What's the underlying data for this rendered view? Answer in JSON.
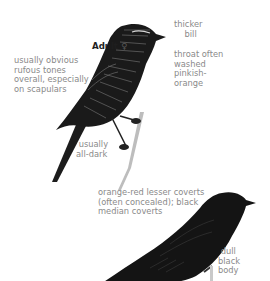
{
  "figure": {
    "top_bird": {
      "title": "Adult",
      "sex_symbol": "♀",
      "annotations": {
        "bill": "thicker\n    bill",
        "throat": "throat often\nwashed\npinkish-\norange",
        "scapulars": "usually obvious\nrufous tones\noverall, especially\non scapulars",
        "legs": " usually\nall-dark"
      }
    },
    "bottom_bird": {
      "annotations": {
        "coverts": "orange-red lesser coverts\n(often concealed); black\nmedian coverts",
        "body": " dull\nblack\nbody"
      }
    },
    "colors": {
      "annotation_text": "#8a8a8a",
      "title_text": "#1e1e1e",
      "plumage_dark": "#161616",
      "plumage_streak": "#6f6f6f",
      "perch": "#b9b9b9"
    }
  }
}
